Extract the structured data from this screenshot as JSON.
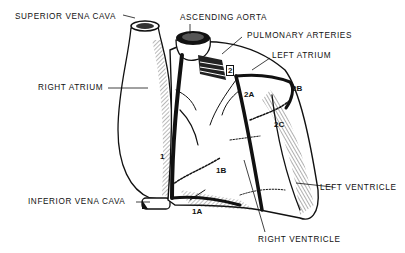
{
  "diagram": {
    "labels": {
      "superior_vena_cava": "SUPERIOR VENA CAVA",
      "ascending_aorta": "ASCENDING AORTA",
      "pulmonary_arteries": "PULMONARY ARTERIES",
      "left_atrium": "LEFT ATRIUM",
      "right_atrium": "RIGHT ATRIUM",
      "inferior_vena_cava": "INFERIOR VENA CAVA",
      "left_ventricle": "LEFT VENTRICLE",
      "right_ventricle": "RIGHT VENTRICLE"
    },
    "markers": {
      "m1": "1",
      "m1a": "1A",
      "m1b": "1B",
      "m2": "2",
      "m2a": "2A",
      "m2b": "2B",
      "m2c": "2C"
    },
    "colors": {
      "ink": "#111111",
      "background": "#ffffff"
    }
  }
}
